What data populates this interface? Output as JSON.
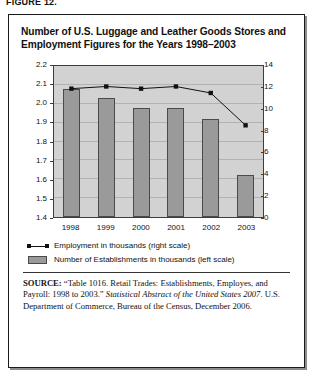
{
  "figure_label": "FIGURE 12.",
  "chart_title": "Number of U.S. Luggage and Leather Goods Stores and Employment Figures for the Years 1998–2003",
  "legend": {
    "employment": "Employment in thousands (right scale)",
    "establishments": "Number of Establishments in thousands (left scale)"
  },
  "source": {
    "prefix": "SOURCE:",
    "part1": " “Table 1016. Retail Trades: Establishments, Employes, and Payroll: 1998 to 2003.” ",
    "italic": "Statistical Abstract of the United States 2007",
    "part2": ". U.S. Department of Commerce, Bureau of the Census, December 2006."
  },
  "colors": {
    "bar_fill": "#9a9a9a",
    "bar_stroke": "#4a4a4a",
    "plot_background": "#d2d2d2",
    "line": "#111111",
    "gridline": "#b2b2b2"
  },
  "chart_data": {
    "type": "bar",
    "title": "Number of U.S. Luggage and Leather Goods Stores and Employment Figures for the Years 1998–2003",
    "xlabel": "",
    "ylabel": "",
    "categories": [
      "1998",
      "1999",
      "2000",
      "2001",
      "2002",
      "2003"
    ],
    "grid": true,
    "legend_position": "below",
    "left_axis": {
      "label": "Number of Establishments in thousands (left scale)",
      "ylim": [
        1.4,
        2.2
      ],
      "ticks": [
        "1.4",
        "1.5",
        "1.6",
        "1.7",
        "1.8",
        "1.9",
        "2.0",
        "2.1",
        "2.2"
      ],
      "tick_values": [
        1.4,
        1.5,
        1.6,
        1.7,
        1.8,
        1.9,
        2.0,
        2.1,
        2.2
      ]
    },
    "right_axis": {
      "label": "Employment in thousands (right scale)",
      "ylim": [
        0,
        14
      ],
      "ticks": [
        "0",
        "2",
        "4",
        "6",
        "8",
        "10",
        "12",
        "14"
      ],
      "tick_values": [
        0,
        2,
        4,
        6,
        8,
        10,
        12,
        14
      ]
    },
    "series": [
      {
        "name": "Number of Establishments in thousands (left scale)",
        "type": "bar",
        "axis": "left",
        "values": [
          2.08,
          2.03,
          1.98,
          1.98,
          1.92,
          1.62
        ]
      },
      {
        "name": "Employment in thousands (right scale)",
        "type": "line",
        "axis": "right",
        "marker": "square",
        "values": [
          11.9,
          12.1,
          11.9,
          12.1,
          11.5,
          8.5
        ]
      }
    ]
  }
}
